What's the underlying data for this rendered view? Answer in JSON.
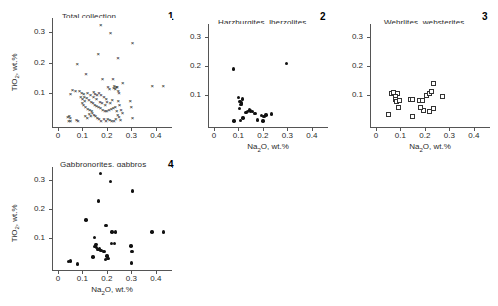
{
  "figure": {
    "axis_x_title": "Na₂O, wt.%",
    "axis_y_title": "TiO₂, wt.%",
    "xlim": [
      -0.02,
      0.47
    ],
    "ylim": [
      -0.012,
      0.345
    ],
    "xticks": [
      0,
      0.1,
      0.2,
      0.3,
      0.4
    ],
    "xticklabels": [
      "0",
      "0.1",
      "0.2",
      "0.3",
      "0.4"
    ],
    "yticks": [
      0.1,
      0.2,
      0.3
    ],
    "yticklabels": [
      "0.1",
      "0.2",
      "0.3"
    ],
    "grid": false,
    "legend": "none"
  },
  "chart_data": [
    {
      "type": "scatter",
      "panel": "1",
      "title": "Total collection",
      "marker": "cross",
      "xlabel": "",
      "ylabel": "TiO₂, wt.%",
      "xlim": [
        -0.02,
        0.47
      ],
      "ylim": [
        -0.012,
        0.345
      ],
      "points": [
        [
          0.175,
          0.322
        ],
        [
          0.215,
          0.296
        ],
        [
          0.305,
          0.262
        ],
        [
          0.165,
          0.228
        ],
        [
          0.245,
          0.212
        ],
        [
          0.079,
          0.193
        ],
        [
          0.115,
          0.163
        ],
        [
          0.182,
          0.145
        ],
        [
          0.225,
          0.145
        ],
        [
          0.385,
          0.124
        ],
        [
          0.43,
          0.124
        ],
        [
          0.265,
          0.132
        ],
        [
          0.23,
          0.122
        ],
        [
          0.238,
          0.12
        ],
        [
          0.242,
          0.118
        ],
        [
          0.228,
          0.115
        ],
        [
          0.234,
          0.112
        ],
        [
          0.246,
          0.108
        ],
        [
          0.25,
          0.1
        ],
        [
          0.205,
          0.118
        ],
        [
          0.211,
          0.112
        ],
        [
          0.06,
          0.11
        ],
        [
          0.072,
          0.105
        ],
        [
          0.052,
          0.098
        ],
        [
          0.088,
          0.106
        ],
        [
          0.097,
          0.1
        ],
        [
          0.106,
          0.096
        ],
        [
          0.121,
          0.101
        ],
        [
          0.133,
          0.095
        ],
        [
          0.146,
          0.104
        ],
        [
          0.152,
          0.098
        ],
        [
          0.16,
          0.092
        ],
        [
          0.168,
          0.1
        ],
        [
          0.176,
          0.094
        ],
        [
          0.188,
          0.088
        ],
        [
          0.197,
          0.082
        ],
        [
          0.093,
          0.086
        ],
        [
          0.101,
          0.08
        ],
        [
          0.11,
          0.075
        ],
        [
          0.118,
          0.084
        ],
        [
          0.127,
          0.078
        ],
        [
          0.136,
          0.072
        ],
        [
          0.143,
          0.066
        ],
        [
          0.151,
          0.062
        ],
        [
          0.158,
          0.058
        ],
        [
          0.166,
          0.054
        ],
        [
          0.174,
          0.05
        ],
        [
          0.183,
          0.046
        ],
        [
          0.192,
          0.042
        ],
        [
          0.2,
          0.04
        ],
        [
          0.209,
          0.044
        ],
        [
          0.218,
          0.048
        ],
        [
          0.226,
          0.052
        ],
        [
          0.234,
          0.056
        ],
        [
          0.247,
          0.074
        ],
        [
          0.252,
          0.06
        ],
        [
          0.258,
          0.046
        ],
        [
          0.264,
          0.036
        ],
        [
          0.296,
          0.074
        ],
        [
          0.3,
          0.056
        ],
        [
          0.305,
          0.018
        ],
        [
          0.04,
          0.022
        ],
        [
          0.046,
          0.026
        ],
        [
          0.05,
          0.018
        ],
        [
          0.044,
          0.01
        ],
        [
          0.052,
          0.008
        ],
        [
          0.076,
          0.012
        ],
        [
          0.082,
          0.01
        ],
        [
          0.112,
          0.026
        ],
        [
          0.12,
          0.02
        ],
        [
          0.128,
          0.032
        ],
        [
          0.134,
          0.026
        ],
        [
          0.14,
          0.036
        ],
        [
          0.147,
          0.03
        ],
        [
          0.154,
          0.024
        ],
        [
          0.161,
          0.018
        ],
        [
          0.168,
          0.014
        ],
        [
          0.176,
          0.01
        ],
        [
          0.188,
          0.014
        ],
        [
          0.196,
          0.01
        ],
        [
          0.204,
          0.016
        ],
        [
          0.212,
          0.012
        ],
        [
          0.22,
          0.008
        ],
        [
          0.229,
          0.01
        ],
        [
          0.236,
          0.014
        ],
        [
          0.105,
          0.06
        ],
        [
          0.113,
          0.054
        ],
        [
          0.122,
          0.048
        ],
        [
          0.13,
          0.044
        ],
        [
          0.138,
          0.04
        ],
        [
          0.1,
          0.068
        ],
        [
          0.108,
          0.088
        ],
        [
          0.158,
          0.08
        ],
        [
          0.145,
          0.086
        ],
        [
          0.172,
          0.072
        ],
        [
          0.18,
          0.066
        ],
        [
          0.193,
          0.06
        ],
        [
          0.201,
          0.072
        ],
        [
          0.214,
          0.066
        ],
        [
          0.222,
          0.078
        ],
        [
          0.24,
          0.042
        ],
        [
          0.244,
          0.03
        ],
        [
          0.25,
          0.022
        ],
        [
          0.256,
          0.012
        ]
      ]
    },
    {
      "type": "scatter",
      "panel": "2",
      "title": "Harzburgites, lherzolites",
      "marker": "dot",
      "xlabel": "Na₂O, wt.%",
      "ylabel": "",
      "xlim": [
        -0.02,
        0.47
      ],
      "ylim": [
        -0.012,
        0.345
      ],
      "points": [
        [
          0.081,
          0.191
        ],
        [
          0.296,
          0.21
        ],
        [
          0.1,
          0.092
        ],
        [
          0.118,
          0.088
        ],
        [
          0.107,
          0.08
        ],
        [
          0.112,
          0.074
        ],
        [
          0.11,
          0.068
        ],
        [
          0.104,
          0.054
        ],
        [
          0.145,
          0.05
        ],
        [
          0.15,
          0.046
        ],
        [
          0.138,
          0.044
        ],
        [
          0.131,
          0.042
        ],
        [
          0.158,
          0.044
        ],
        [
          0.168,
          0.038
        ],
        [
          0.195,
          0.03
        ],
        [
          0.204,
          0.028
        ],
        [
          0.212,
          0.032
        ],
        [
          0.236,
          0.036
        ],
        [
          0.119,
          0.022
        ],
        [
          0.178,
          0.016
        ],
        [
          0.2,
          0.012
        ],
        [
          0.082,
          0.012
        ],
        [
          0.108,
          0.014
        ]
      ]
    },
    {
      "type": "scatter",
      "panel": "3",
      "title": "Wehrlites, websterites",
      "marker": "open-square",
      "xlabel": "Na₂O, wt.%",
      "ylabel": "",
      "xlim": [
        -0.02,
        0.47
      ],
      "ylim": [
        -0.012,
        0.345
      ],
      "points": [
        [
          0.063,
          0.106
        ],
        [
          0.073,
          0.11
        ],
        [
          0.09,
          0.108
        ],
        [
          0.08,
          0.096
        ],
        [
          0.078,
          0.086
        ],
        [
          0.085,
          0.078
        ],
        [
          0.098,
          0.084
        ],
        [
          0.14,
          0.086
        ],
        [
          0.151,
          0.086
        ],
        [
          0.18,
          0.082
        ],
        [
          0.19,
          0.084
        ],
        [
          0.205,
          0.098
        ],
        [
          0.218,
          0.108
        ],
        [
          0.228,
          0.112
        ],
        [
          0.236,
          0.142
        ],
        [
          0.272,
          0.096
        ],
        [
          0.092,
          0.058
        ],
        [
          0.15,
          0.026
        ],
        [
          0.196,
          0.048
        ],
        [
          0.218,
          0.044
        ],
        [
          0.236,
          0.054
        ],
        [
          0.052,
          0.036
        ],
        [
          0.182,
          0.06
        ]
      ]
    },
    {
      "type": "scatter",
      "panel": "4",
      "title": "Gabbronorites, gabbros",
      "marker": "dot",
      "xlabel": "Na₂O, wt.%",
      "ylabel": "TiO₂, wt.%",
      "xlim": [
        -0.02,
        0.47
      ],
      "ylim": [
        -0.012,
        0.345
      ],
      "points": [
        [
          0.175,
          0.322
        ],
        [
          0.215,
          0.296
        ],
        [
          0.305,
          0.262
        ],
        [
          0.165,
          0.228
        ],
        [
          0.115,
          0.163
        ],
        [
          0.196,
          0.145
        ],
        [
          0.221,
          0.122
        ],
        [
          0.235,
          0.122
        ],
        [
          0.385,
          0.122
        ],
        [
          0.43,
          0.122
        ],
        [
          0.15,
          0.102
        ],
        [
          0.232,
          0.082
        ],
        [
          0.218,
          0.083
        ],
        [
          0.155,
          0.08
        ],
        [
          0.152,
          0.073
        ],
        [
          0.157,
          0.068
        ],
        [
          0.163,
          0.062
        ],
        [
          0.17,
          0.064
        ],
        [
          0.176,
          0.058
        ],
        [
          0.188,
          0.055
        ],
        [
          0.298,
          0.074
        ],
        [
          0.302,
          0.056
        ],
        [
          0.143,
          0.036
        ],
        [
          0.2,
          0.04
        ],
        [
          0.205,
          0.03
        ],
        [
          0.194,
          0.028
        ],
        [
          0.3,
          0.016
        ],
        [
          0.044,
          0.02
        ],
        [
          0.052,
          0.022
        ],
        [
          0.08,
          0.012
        ]
      ]
    }
  ]
}
